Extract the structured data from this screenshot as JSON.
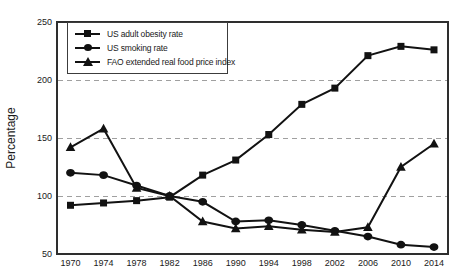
{
  "colors": {
    "background": "#ffffff",
    "series": "#121212",
    "grid": "#a0a0a0",
    "axis": "#2e2e2e",
    "text": "#1a1a1a"
  },
  "chart_data": {
    "type": "line",
    "title": "",
    "xlabel": "",
    "ylabel": "Percentage",
    "x": [
      "1970",
      "1974",
      "1978",
      "1982",
      "1986",
      "1990",
      "1994",
      "1998",
      "2002",
      "2006",
      "2010",
      "2014"
    ],
    "ylim": [
      50,
      250
    ],
    "yticks": [
      50,
      100,
      150,
      200,
      250
    ],
    "gridlines": [
      100,
      150,
      200
    ],
    "grid_style": "horizontal-dashed",
    "legend_position": "upper-left-inside",
    "series": [
      {
        "name": "US adult obesity rate",
        "marker": "square",
        "values": [
          92,
          94,
          96,
          99,
          118,
          131,
          153,
          179,
          193,
          221,
          229,
          226
        ]
      },
      {
        "name": "US smoking rate",
        "marker": "circle",
        "values": [
          120,
          118,
          109,
          100,
          95,
          78,
          79,
          75,
          70,
          65,
          58,
          56
        ]
      },
      {
        "name": "FAO extended real food price index",
        "marker": "triangle",
        "values": [
          142,
          158,
          107,
          100,
          78,
          72,
          74,
          71,
          69,
          73,
          125,
          145
        ]
      }
    ]
  }
}
